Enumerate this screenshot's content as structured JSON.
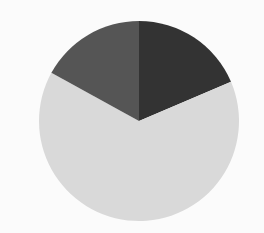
{
  "chart_data": {
    "type": "pie",
    "title": "",
    "categories": [
      "Slice A",
      "Slice B",
      "Slice C"
    ],
    "values": [
      18.6,
      64.4,
      17.0
    ],
    "colors": [
      "#333333",
      "#d9d9d9",
      "#555555"
    ],
    "start_angle_deg": 0,
    "direction": "clockwise",
    "legend": null,
    "labels_visible": false,
    "center": [
      139,
      121
    ],
    "radius": 100
  }
}
